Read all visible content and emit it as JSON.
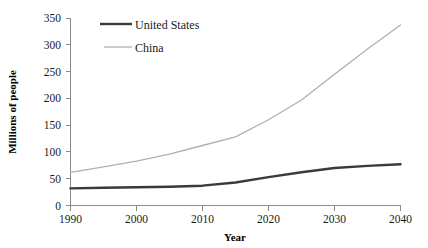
{
  "chart_data": {
    "type": "line",
    "title": "",
    "xlabel": "Year",
    "ylabel": "Millions of people",
    "x": [
      1990,
      1995,
      2000,
      2005,
      2010,
      2015,
      2020,
      2025,
      2030,
      2035,
      2040
    ],
    "xlim": [
      1990,
      2040
    ],
    "ylim": [
      0,
      350
    ],
    "xticks": [
      "1990",
      "2000",
      "2010",
      "2020",
      "2030",
      "2040"
    ],
    "xtick_values": [
      1990,
      2000,
      2010,
      2020,
      2030,
      2040
    ],
    "yticks": [
      "0",
      "50",
      "100",
      "150",
      "200",
      "250",
      "300",
      "350"
    ],
    "ytick_values": [
      0,
      50,
      100,
      150,
      200,
      250,
      300,
      350
    ],
    "grid": false,
    "legend_position": "top-center",
    "series": [
      {
        "name": "United States",
        "color": "#3a3a3a",
        "width": 2.4,
        "values": [
          32,
          33,
          34,
          35,
          37,
          43,
          53,
          62,
          70,
          74,
          77
        ]
      },
      {
        "name": "China",
        "color": "#b0b0b0",
        "width": 1.3,
        "values": [
          62,
          72,
          83,
          96,
          112,
          128,
          160,
          197,
          245,
          292,
          337
        ]
      }
    ]
  },
  "legend": {
    "items": [
      {
        "label": "United States",
        "color": "#3a3a3a"
      },
      {
        "label": "China",
        "color": "#b0b0b0"
      }
    ]
  },
  "axes": {
    "x_title": "Year",
    "y_title": "Millions of people"
  }
}
